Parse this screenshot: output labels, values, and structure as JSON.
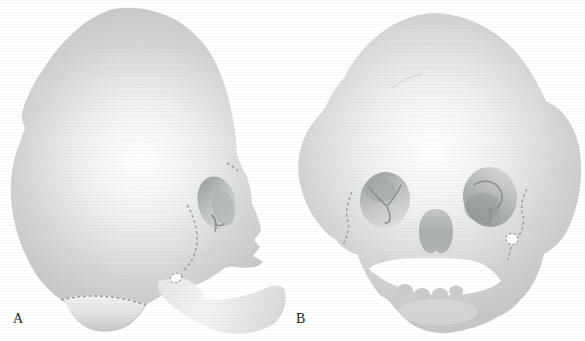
{
  "figure": {
    "panels": [
      {
        "id": "A",
        "label": "A",
        "illustration": "skull-lateral-view"
      },
      {
        "id": "B",
        "label": "B",
        "illustration": "skull-frontal-cloverleaf-view"
      }
    ],
    "colors": {
      "background": "#ffffff",
      "bone_edge": "#c5c8c6",
      "bone_highlight": "#ffffff",
      "orbit_shadow": "#989e9a",
      "suture_dash": "#99a09a",
      "mandible_light": "#f3f4f3",
      "label_text": "#1c1c1c"
    }
  }
}
